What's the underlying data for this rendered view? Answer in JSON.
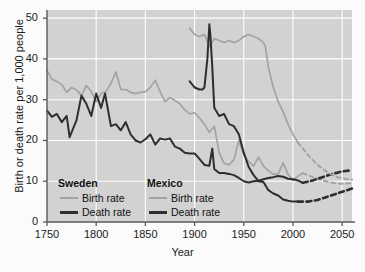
{
  "chart_data": {
    "type": "line",
    "title": "",
    "xlabel": "Year",
    "ylabel": "Birth or death rate per 1,000 people",
    "xlim": [
      1750,
      2060
    ],
    "ylim": [
      0,
      52
    ],
    "xticks": [
      1750,
      1800,
      1850,
      1900,
      1950,
      2000,
      2050
    ],
    "yticks": [
      0,
      10,
      20,
      30,
      40,
      50
    ],
    "grid": true,
    "legend_position": "inside-lower-left",
    "colors": {
      "birth_rate": "#a3a3a3",
      "death_rate": "#2e2e2e",
      "plot_background": "#d2d2d2",
      "gridline": "#ffffff",
      "axis": "#5a5a5a"
    },
    "series": [
      {
        "name": "Sweden Birth rate",
        "country": "Sweden",
        "measure": "Birth rate",
        "color": "#a3a3a3",
        "style": "solid",
        "x": [
          1750,
          1755,
          1760,
          1765,
          1770,
          1775,
          1780,
          1785,
          1790,
          1795,
          1800,
          1805,
          1810,
          1815,
          1820,
          1825,
          1830,
          1835,
          1840,
          1845,
          1850,
          1855,
          1860,
          1865,
          1870,
          1875,
          1880,
          1885,
          1890,
          1895,
          1900,
          1905,
          1910,
          1915,
          1920,
          1925,
          1930,
          1935,
          1940,
          1945,
          1950,
          1955,
          1960,
          1965,
          1970,
          1975,
          1980,
          1985,
          1990,
          1995,
          2000,
          2005,
          2010
        ],
        "y": [
          37.2,
          35.0,
          34.5,
          33.7,
          31.8,
          33.0,
          32.4,
          31.0,
          33.5,
          32.0,
          29.5,
          31.5,
          32.0,
          34.0,
          36.8,
          32.5,
          32.5,
          31.8,
          31.5,
          31.8,
          32.0,
          33.0,
          34.8,
          32.0,
          29.5,
          30.5,
          29.8,
          29.0,
          27.5,
          26.5,
          26.8,
          25.5,
          24.0,
          22.0,
          23.5,
          17.0,
          14.4,
          14.0,
          15.3,
          20.0,
          16.5,
          14.8,
          13.7,
          15.9,
          13.7,
          12.6,
          11.7,
          11.8,
          14.5,
          11.7,
          10.2,
          11.2,
          12.0
        ]
      },
      {
        "name": "Sweden Death rate",
        "country": "Sweden",
        "measure": "Death rate",
        "color": "#2e2e2e",
        "style": "solid",
        "x": [
          1750,
          1755,
          1760,
          1765,
          1770,
          1773,
          1780,
          1785,
          1790,
          1795,
          1800,
          1805,
          1809,
          1815,
          1820,
          1825,
          1830,
          1835,
          1840,
          1845,
          1850,
          1855,
          1860,
          1865,
          1870,
          1875,
          1880,
          1885,
          1890,
          1895,
          1900,
          1905,
          1910,
          1915,
          1918,
          1920,
          1925,
          1930,
          1935,
          1940,
          1945,
          1950,
          1955,
          1960,
          1965,
          1970,
          1975,
          1980,
          1985,
          1990,
          1995,
          2000,
          2005,
          2010
        ],
        "y": [
          27.3,
          25.8,
          26.5,
          24.5,
          26.0,
          20.8,
          25.0,
          31.0,
          29.0,
          26.0,
          31.5,
          28.0,
          31.5,
          23.5,
          24.0,
          22.5,
          24.5,
          21.5,
          20.0,
          19.5,
          20.3,
          21.5,
          19.0,
          20.5,
          20.2,
          20.5,
          18.5,
          18.0,
          17.0,
          16.8,
          16.8,
          15.5,
          14.0,
          13.8,
          18.0,
          13.0,
          12.0,
          12.0,
          11.8,
          11.5,
          10.8,
          10.0,
          9.7,
          10.0,
          10.1,
          10.5,
          10.8,
          11.0,
          11.3,
          11.1,
          10.6,
          10.5,
          10.2,
          9.6
        ]
      },
      {
        "name": "Mexico Birth rate",
        "country": "Mexico",
        "measure": "Birth rate",
        "color": "#a3a3a3",
        "style": "solid",
        "x": [
          1895,
          1900,
          1905,
          1910,
          1915,
          1920,
          1925,
          1930,
          1935,
          1940,
          1945,
          1950,
          1955,
          1960,
          1965,
          1970,
          1972,
          1975,
          1980,
          1985,
          1990,
          1995,
          2000,
          2005
        ],
        "y": [
          47.5,
          46.0,
          45.5,
          46.0,
          43.0,
          45.0,
          44.5,
          44.0,
          44.5,
          44.0,
          44.5,
          45.5,
          46.0,
          45.5,
          45.0,
          44.0,
          43.0,
          38.0,
          33.0,
          29.5,
          27.0,
          24.0,
          21.5,
          19.5
        ]
      },
      {
        "name": "Mexico Death rate",
        "country": "Mexico",
        "measure": "Death rate",
        "color": "#2e2e2e",
        "style": "solid",
        "x": [
          1895,
          1900,
          1905,
          1908,
          1910,
          1913,
          1915,
          1916,
          1918,
          1920,
          1925,
          1930,
          1935,
          1940,
          1945,
          1950,
          1955,
          1960,
          1965,
          1970,
          1975,
          1980,
          1985,
          1990,
          1995,
          2000,
          2005
        ],
        "y": [
          34.5,
          33.0,
          32.5,
          32.5,
          33.0,
          40.0,
          48.5,
          46.0,
          38.0,
          28.0,
          26.0,
          26.5,
          24.0,
          23.5,
          21.5,
          17.0,
          13.5,
          11.5,
          10.0,
          9.8,
          7.8,
          7.0,
          6.5,
          5.5,
          5.2,
          5.0,
          5.0
        ]
      },
      {
        "name": "Sweden Birth rate (projected)",
        "country": "Sweden",
        "measure": "Birth rate",
        "color": "#a3a3a3",
        "style": "dashed",
        "x": [
          2010,
          2020,
          2030,
          2040,
          2050,
          2060
        ],
        "y": [
          12.0,
          11.0,
          10.2,
          9.6,
          9.4,
          9.5
        ]
      },
      {
        "name": "Sweden Death rate (projected)",
        "country": "Sweden",
        "measure": "Death rate",
        "color": "#2e2e2e",
        "style": "dashed",
        "x": [
          2010,
          2020,
          2030,
          2040,
          2050,
          2060
        ],
        "y": [
          9.6,
          10.2,
          11.0,
          11.8,
          12.4,
          12.7
        ]
      },
      {
        "name": "Mexico Birth rate (projected)",
        "country": "Mexico",
        "measure": "Birth rate",
        "color": "#a3a3a3",
        "style": "dashed",
        "x": [
          2005,
          2015,
          2025,
          2035,
          2045,
          2055,
          2060
        ],
        "y": [
          19.5,
          16.5,
          14.0,
          12.2,
          11.0,
          10.5,
          10.4
        ]
      },
      {
        "name": "Mexico Death rate (projected)",
        "country": "Mexico",
        "measure": "Death rate",
        "color": "#2e2e2e",
        "style": "dashed",
        "x": [
          2005,
          2015,
          2025,
          2035,
          2045,
          2055,
          2060
        ],
        "y": [
          5.0,
          5.0,
          5.4,
          6.2,
          7.0,
          7.8,
          8.2
        ]
      }
    ],
    "annotations": [
      {
        "text": "Mexican Revolution death-rate spike",
        "x": 1915,
        "y": 48.5
      }
    ]
  },
  "axes": {
    "ylabel": "Birth or death rate per 1,000 people",
    "xlabel": "Year",
    "yticks": [
      "50",
      "40",
      "30",
      "20",
      "10",
      "0"
    ],
    "xticks": [
      "1750",
      "1800",
      "1850",
      "1900",
      "1950",
      "2000",
      "2050"
    ]
  },
  "legend": {
    "groups": [
      {
        "title": "Sweden",
        "entries": [
          {
            "label": "Birth rate",
            "color": "#a3a3a3",
            "weight": "thin"
          },
          {
            "label": "Death rate",
            "color": "#2e2e2e",
            "weight": "thick"
          }
        ]
      },
      {
        "title": "Mexico",
        "entries": [
          {
            "label": "Birth rate",
            "color": "#a3a3a3",
            "weight": "thin"
          },
          {
            "label": "Death rate",
            "color": "#2e2e2e",
            "weight": "thick"
          }
        ]
      }
    ]
  }
}
